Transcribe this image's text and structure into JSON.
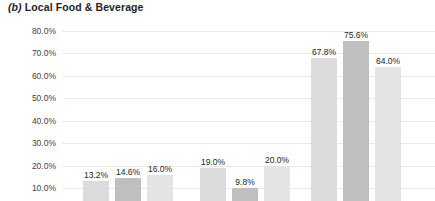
{
  "title": {
    "panel_letter": "(b)",
    "text": "Local Food & Beverage",
    "full": "(b) Local Food & Beverage"
  },
  "chart_data": {
    "type": "bar",
    "title": "(b) Local Food & Beverage",
    "xlabel": "",
    "ylabel": "",
    "ylim": [
      0,
      80
    ],
    "grid": true,
    "legend": "none",
    "yticks": [
      "10.0%",
      "20.0%",
      "30.0%",
      "40.0%",
      "50.0%",
      "60.0%",
      "70.0%",
      "80.0%"
    ],
    "ytick_values": [
      10,
      20,
      30,
      40,
      50,
      60,
      70,
      80
    ],
    "categories": [
      "group-1",
      "group-2",
      "group-3"
    ],
    "series": [
      {
        "name": "series-1",
        "values": [
          13.2,
          19.0,
          67.8
        ],
        "color": "#dcdcdc"
      },
      {
        "name": "series-2",
        "values": [
          14.6,
          9.8,
          75.6
        ],
        "color": "#bfbfbf"
      },
      {
        "name": "series-3",
        "values": [
          16.0,
          20.0,
          64.0
        ],
        "color": "#e4e4e4"
      }
    ],
    "bars": [
      {
        "name": "bar-g1-s1",
        "group": "group-1",
        "series": "series-1",
        "value": 13.2,
        "label": "13.2%",
        "color": "#dcdcdc",
        "x": 21,
        "width": 26
      },
      {
        "name": "bar-g1-s2",
        "group": "group-1",
        "series": "series-2",
        "value": 14.6,
        "label": "14.6%",
        "color": "#bfbfbf",
        "x": 53,
        "width": 26
      },
      {
        "name": "bar-g1-s3",
        "group": "group-1",
        "series": "series-3",
        "value": 16.0,
        "label": "16.0%",
        "color": "#e4e4e4",
        "x": 85,
        "width": 26
      },
      {
        "name": "bar-g2-s1",
        "group": "group-2",
        "series": "series-1",
        "value": 19.0,
        "label": "19.0%",
        "color": "#dcdcdc",
        "x": 138,
        "width": 26
      },
      {
        "name": "bar-g2-s2",
        "group": "group-2",
        "series": "series-2",
        "value": 9.8,
        "label": "9.8%",
        "color": "#bfbfbf",
        "x": 170,
        "width": 26
      },
      {
        "name": "bar-g2-s3",
        "group": "group-2",
        "series": "series-3",
        "value": 20.0,
        "label": "20.0%",
        "color": "#e4e4e4",
        "x": 202,
        "width": 26
      },
      {
        "name": "bar-g3-s1",
        "group": "group-3",
        "series": "series-1",
        "value": 67.8,
        "label": "67.8%",
        "color": "#dcdcdc",
        "x": 249,
        "width": 26
      },
      {
        "name": "bar-g3-s2",
        "group": "group-3",
        "series": "series-2",
        "value": 75.6,
        "label": "75.6%",
        "color": "#bfbfbf",
        "x": 281,
        "width": 26
      },
      {
        "name": "bar-g3-s3",
        "group": "group-3",
        "series": "series-3",
        "value": 64.0,
        "label": "64.0%",
        "color": "#e4e4e4",
        "x": 313,
        "width": 26
      }
    ]
  },
  "colors": {
    "gridline": "#e9e9ea",
    "text": "#231f20",
    "axis_text": "#3f3f3f",
    "background": "#ffffff"
  }
}
